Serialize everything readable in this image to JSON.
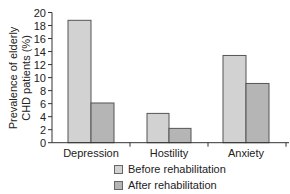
{
  "chart_data": {
    "type": "bar",
    "title": "",
    "xlabel": "",
    "ylabel": "Prevalence of elderly CHD patients (%)",
    "ylabel_lines": [
      "Prevalence of elderly",
      "CHD patients (%)"
    ],
    "categories": [
      "Depression",
      "Hostility",
      "Anxiety"
    ],
    "series": [
      {
        "name": "Before rehabilitation",
        "values": [
          18.8,
          4.5,
          13.4
        ],
        "color": "#d2d2d2"
      },
      {
        "name": "After rehabilitation",
        "values": [
          6.1,
          2.2,
          9.1
        ],
        "color": "#b5b5b5"
      }
    ],
    "ylim": [
      0,
      20
    ],
    "yticks": [
      0,
      2,
      4,
      6,
      8,
      10,
      12,
      14,
      16,
      18,
      20
    ],
    "grid": false,
    "legend_position": "bottom"
  },
  "legend": {
    "items": [
      {
        "label": "Before rehabilitation",
        "color": "#d2d2d2"
      },
      {
        "label": "After rehabilitation",
        "color": "#b5b5b5"
      }
    ]
  }
}
